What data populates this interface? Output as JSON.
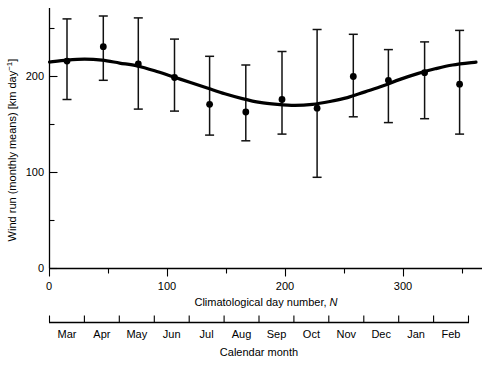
{
  "chart_data": {
    "type": "scatter",
    "title": "",
    "xlabel": "Climatological day number, N",
    "ylabel": "Wind run (monthly means) [km day−1]",
    "secondary_xlabel": "Calendar month",
    "xlim": [
      0,
      365
    ],
    "ylim": [
      0,
      260
    ],
    "grid": false,
    "legend": "none",
    "y_ticks": [
      0,
      100,
      200
    ],
    "y_tick_labels": [
      "0",
      "100",
      "200"
    ],
    "y_minor_ticks": [
      50,
      150,
      250
    ],
    "x_ticks": [
      0,
      100,
      200,
      300
    ],
    "x_tick_labels": [
      "0",
      "100",
      "200",
      "300"
    ],
    "x_minor_ticks": [
      50,
      150,
      250,
      350
    ],
    "months": [
      "Mar",
      "Apr",
      "May",
      "Jun",
      "Jul",
      "Aug",
      "Sep",
      "Oct",
      "Nov",
      "Dec",
      "Jan",
      "Feb"
    ],
    "series": [
      {
        "name": "Monthly mean wind run",
        "marker": "filled-circle",
        "x": [
          15,
          46,
          76,
          107,
          137,
          168,
          199,
          229,
          260,
          290,
          321,
          351
        ],
        "values": [
          216,
          231,
          213,
          199,
          171,
          163,
          176,
          167,
          200,
          196,
          204,
          192
        ],
        "err_upper": [
          260,
          263,
          261,
          239,
          221,
          212,
          226,
          249,
          244,
          228,
          236,
          248
        ],
        "err_lower": [
          176,
          196,
          166,
          164,
          139,
          133,
          140,
          95,
          158,
          152,
          156,
          140
        ]
      },
      {
        "name": "Fitted harmonic curve",
        "marker": "none",
        "x": [
          0,
          15,
          30,
          45,
          60,
          75,
          90,
          105,
          120,
          135,
          150,
          165,
          180,
          195,
          210,
          225,
          240,
          255,
          270,
          285,
          300,
          315,
          330,
          345,
          365
        ],
        "values": [
          215,
          217,
          218,
          217,
          214,
          211,
          206,
          200,
          194,
          188,
          182,
          177,
          173,
          171,
          170,
          171,
          174,
          178,
          184,
          190,
          197,
          203,
          208,
          212,
          215
        ]
      }
    ]
  },
  "axes": {
    "y_label_text": "Wind run (monthly means) [km day",
    "y_label_exp": "−1",
    "y_label_tail": "]",
    "x_label_main": "Climatological day number,",
    "x_label_symbol": "N",
    "month_label": "Calendar month"
  }
}
